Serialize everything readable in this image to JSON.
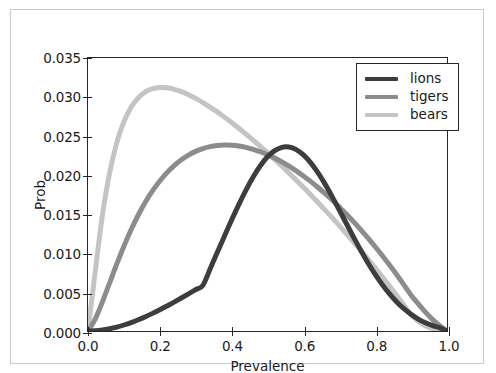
{
  "figure": {
    "background": "#ffffff",
    "frame_color": "#c8c8c8",
    "axes_color": "#262626"
  },
  "legend": {
    "position": "upper right",
    "entries": [
      {
        "label": "lions",
        "color": "#3d3d3d"
      },
      {
        "label": "tigers",
        "color": "#8c8c8c"
      },
      {
        "label": "bears",
        "color": "#c4c4c4"
      }
    ]
  },
  "axis": {
    "xlabel": "Prevalence",
    "ylabel": "Prob",
    "xticks": [
      "0.0",
      "0.2",
      "0.4",
      "0.6",
      "0.8",
      "1.0"
    ],
    "yticks": [
      "0.000",
      "0.005",
      "0.010",
      "0.015",
      "0.020",
      "0.025",
      "0.030",
      "0.035"
    ]
  },
  "chart_data": {
    "type": "line",
    "title": "",
    "xlabel": "Prevalence",
    "ylabel": "Prob",
    "xlim": [
      0.0,
      1.0
    ],
    "ylim": [
      0.0,
      0.035
    ],
    "xticks": [
      0.0,
      0.2,
      0.4,
      0.6,
      0.8,
      1.0
    ],
    "yticks": [
      0.0,
      0.005,
      0.01,
      0.015,
      0.02,
      0.025,
      0.03,
      0.035
    ],
    "grid": false,
    "legend_position": "upper right",
    "x": [
      0.0,
      0.02,
      0.04,
      0.06,
      0.08,
      0.1,
      0.12,
      0.14,
      0.16,
      0.18,
      0.2,
      0.22,
      0.24,
      0.26,
      0.28,
      0.3,
      0.32,
      0.34,
      0.36,
      0.38,
      0.4,
      0.42,
      0.44,
      0.46,
      0.48,
      0.5,
      0.52,
      0.54,
      0.56,
      0.58,
      0.6,
      0.62,
      0.64,
      0.66,
      0.68,
      0.7,
      0.72,
      0.74,
      0.76,
      0.78,
      0.8,
      0.82,
      0.84,
      0.86,
      0.88,
      0.9,
      0.92,
      0.94,
      0.96,
      0.98,
      1.0
    ],
    "series": [
      {
        "name": "lions",
        "color": "#3d3d3d",
        "peak_x": 0.43,
        "peak_y": 0.0236,
        "values": [
          0.0,
          3e-05,
          0.00013,
          0.00029,
          0.0005,
          0.00077,
          0.00108,
          0.00144,
          0.00183,
          0.00226,
          0.00272,
          0.0032,
          0.00371,
          0.00423,
          0.00476,
          0.0053,
          0.00586,
          0.00795,
          0.01006,
          0.01216,
          0.01423,
          0.01621,
          0.01807,
          0.01975,
          0.02119,
          0.02233,
          0.02312,
          0.02355,
          0.02359,
          0.02326,
          0.02258,
          0.02159,
          0.02033,
          0.01886,
          0.01723,
          0.01551,
          0.01375,
          0.01201,
          0.01032,
          0.00873,
          0.00726,
          0.00593,
          0.00476,
          0.00373,
          0.00286,
          0.00213,
          0.00153,
          0.00105,
          0.00068,
          0.00041,
          0.0
        ]
      },
      {
        "name": "tigers",
        "color": "#8c8c8c",
        "peak_x": 0.28,
        "peak_y": 0.0256,
        "values": [
          0.0,
          0.00152,
          0.00371,
          0.00614,
          0.00857,
          0.01087,
          0.01298,
          0.01487,
          0.01654,
          0.01799,
          0.01924,
          0.02031,
          0.02121,
          0.02196,
          0.02256,
          0.02303,
          0.02339,
          0.02364,
          0.02379,
          0.02385,
          0.02382,
          0.02372,
          0.02354,
          0.02329,
          0.02298,
          0.0226,
          0.02217,
          0.02168,
          0.02113,
          0.02053,
          0.01988,
          0.01918,
          0.01843,
          0.01763,
          0.01679,
          0.0159,
          0.01497,
          0.01399,
          0.01297,
          0.01191,
          0.0108,
          0.00965,
          0.00845,
          0.00721,
          0.00592,
          0.00459,
          0.00348,
          0.00241,
          0.00146,
          0.00068,
          0.0
        ]
      },
      {
        "name": "bears",
        "color": "#c4c4c4",
        "peak_x": 0.14,
        "peak_y": 0.0318,
        "values": [
          0.0,
          0.00756,
          0.01478,
          0.02022,
          0.02412,
          0.02683,
          0.02868,
          0.02989,
          0.03065,
          0.03106,
          0.03122,
          0.03118,
          0.03099,
          0.03069,
          0.03029,
          0.02982,
          0.02929,
          0.02871,
          0.02809,
          0.02742,
          0.02673,
          0.026,
          0.02525,
          0.02447,
          0.02367,
          0.02284,
          0.022,
          0.02113,
          0.02024,
          0.01934,
          0.01842,
          0.01747,
          0.01651,
          0.01553,
          0.01453,
          0.01351,
          0.01247,
          0.01141,
          0.01032,
          0.00922,
          0.00809,
          0.00694,
          0.00576,
          0.00456,
          0.00334,
          0.00209,
          0.00126,
          0.00068,
          0.0003,
          8e-05,
          0.0
        ]
      }
    ]
  }
}
